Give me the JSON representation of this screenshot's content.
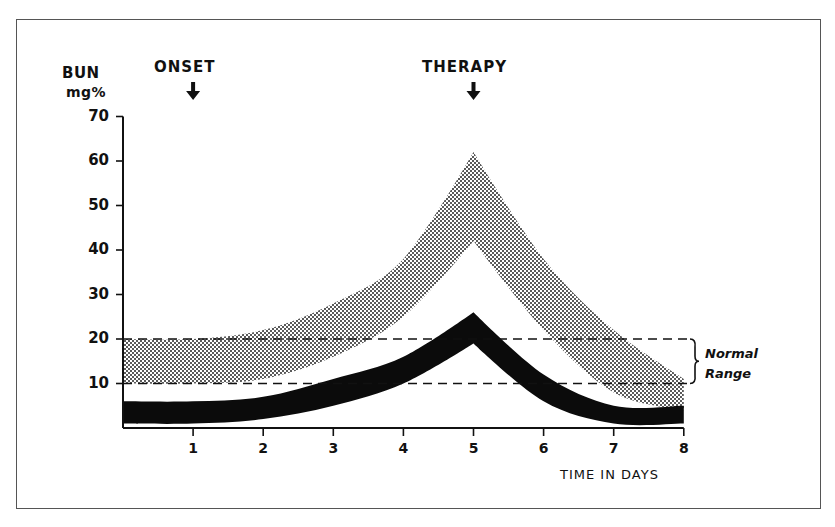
{
  "chart_data": {
    "type": "area",
    "title": "",
    "ylabel": "BUN mg%",
    "ylabel_line1": "BUN",
    "ylabel_line2": "mg%",
    "xlabel": "TIME IN DAYS",
    "ylim": [
      0,
      70
    ],
    "xlim": [
      0,
      8
    ],
    "yticks": [
      "70",
      "60",
      "50",
      "40",
      "30",
      "20",
      "10"
    ],
    "xticks": [
      "1",
      "2",
      "3",
      "4",
      "5",
      "6",
      "7",
      "8"
    ],
    "grid": false,
    "annotations": [
      {
        "label": "ONSET",
        "x": 1,
        "marker": "down-arrow"
      },
      {
        "label": "THERAPY",
        "x": 5,
        "marker": "down-arrow"
      }
    ],
    "reference_band": {
      "label_line1": "Normal",
      "label_line2": "Range",
      "lower": 10,
      "upper": 20,
      "style": "dashed"
    },
    "series": [
      {
        "name": "Upper band (stippled)",
        "style": "stippled-gray",
        "x": [
          0,
          1,
          2,
          3,
          4,
          5,
          6,
          7,
          8
        ],
        "upper": [
          20,
          20,
          22,
          28,
          38,
          62,
          38,
          22,
          11
        ],
        "lower": [
          10,
          10,
          11,
          16,
          25,
          42,
          22,
          8,
          4
        ]
      },
      {
        "name": "Lower band (solid black)",
        "style": "solid-black",
        "x": [
          0,
          1,
          2,
          3,
          4,
          5,
          6,
          7,
          8
        ],
        "upper": [
          6,
          6,
          7,
          11,
          16,
          26,
          12,
          5,
          5
        ],
        "lower": [
          1,
          1,
          2,
          5,
          10,
          19,
          6,
          1,
          1
        ]
      }
    ]
  }
}
